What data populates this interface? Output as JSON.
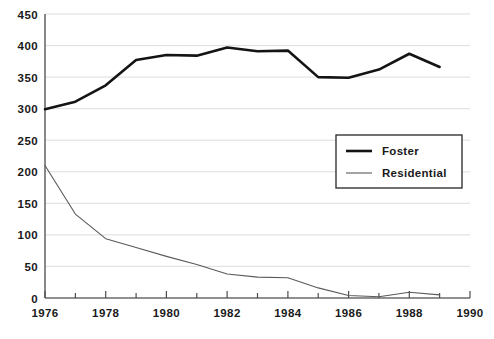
{
  "chart_data": {
    "type": "line",
    "title": "",
    "subtitle": "",
    "xlabel": "",
    "ylabel": "",
    "x": [
      1976,
      1977,
      1978,
      1979,
      1980,
      1981,
      1982,
      1983,
      1984,
      1985,
      1986,
      1987,
      1988,
      1989
    ],
    "xlim": [
      1976,
      1990
    ],
    "ylim": [
      0,
      450
    ],
    "grid": true,
    "legend_position": "center-right",
    "x_ticks_major": [
      "1976",
      "1978",
      "1980",
      "1982",
      "1984",
      "1986",
      "1988",
      "1990"
    ],
    "x_ticks_major_values": [
      1976,
      1978,
      1980,
      1982,
      1984,
      1986,
      1988,
      1990
    ],
    "x_ticks_minor_values": [
      1977,
      1979,
      1981,
      1983,
      1985,
      1987,
      1989
    ],
    "y_ticks": [
      "0",
      "50",
      "100",
      "150",
      "200",
      "250",
      "300",
      "350",
      "400",
      "450"
    ],
    "y_tick_values": [
      0,
      50,
      100,
      150,
      200,
      250,
      300,
      350,
      400,
      450
    ],
    "series": [
      {
        "name": "Foster",
        "color": "#141414",
        "line_width": "thick",
        "values": [
          299,
          311,
          337,
          377,
          385,
          384,
          397,
          391,
          392,
          350,
          349,
          362,
          387,
          366
        ]
      },
      {
        "name": "Residential",
        "color": "#5a5a5a",
        "line_width": "thin",
        "values": [
          210,
          133,
          94,
          80,
          66,
          53,
          38,
          33,
          32,
          16,
          4,
          2,
          9,
          5
        ]
      }
    ],
    "legend": [
      {
        "label": "Foster",
        "color": "#141414",
        "line_width": "thick"
      },
      {
        "label": "Residential",
        "color": "#5a5a5a",
        "line_width": "thin"
      }
    ]
  },
  "colors": {
    "background": "#ffffff",
    "grid": "#d9d9d9",
    "axis": "#6b6b6b",
    "text": "#1a1a1a",
    "foster": "#141414",
    "residential": "#5a5a5a"
  }
}
